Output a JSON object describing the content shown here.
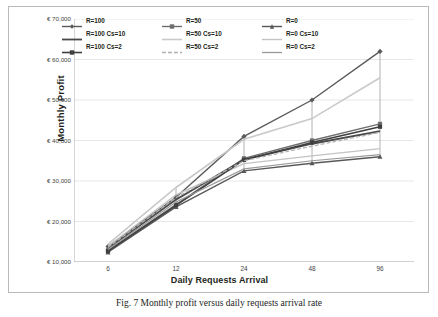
{
  "figure": {
    "caption": "Fig. 7 Monthly profit versus daily requests arrival rate",
    "background": "#ffffff",
    "border_color": "#b9b9b9"
  },
  "chart_data": {
    "type": "line",
    "title": "",
    "xlabel": "Daily Requests Arrival",
    "ylabel": "Monthly  Profit",
    "categories": [
      "6",
      "12",
      "24",
      "48",
      "96"
    ],
    "x_tick_labels": [
      "6",
      "12",
      "24",
      "48",
      "96"
    ],
    "y_tick_labels": [
      "€ 10,000",
      "€ 20,000",
      "€ 30,000",
      "€ 40,000",
      "€ 50,000",
      "€ 60,000",
      "€ 70,000"
    ],
    "y_tick_values": [
      10000,
      20000,
      30000,
      40000,
      50000,
      60000,
      70000
    ],
    "ylim": [
      10000,
      70000
    ],
    "grid": true,
    "grid_axis": "y",
    "legend_position": "top",
    "legend_columns": 3,
    "series": [
      {
        "name": "R=100",
        "color": "#5a5a5a",
        "marker": "diamond",
        "width": 1.4,
        "dash": "none",
        "values": [
          13800,
          26000,
          41000,
          50000,
          62000
        ]
      },
      {
        "name": "R=50",
        "color": "#6e6e6e",
        "marker": "square",
        "width": 1.4,
        "dash": "none",
        "values": [
          12900,
          24200,
          35600,
          40000,
          44100
        ]
      },
      {
        "name": "R=0",
        "color": "#585858",
        "marker": "triangle",
        "width": 1.4,
        "dash": "none",
        "values": [
          12400,
          23600,
          32500,
          34400,
          36000
        ]
      },
      {
        "name": "R=100 Cs=10",
        "color": "#4a4a4a",
        "marker": "none",
        "width": 1.8,
        "dash": "none",
        "values": [
          13400,
          25400,
          35300,
          39200,
          42300
        ]
      },
      {
        "name": "R=50 Cs=10",
        "color": "#c9c9c9",
        "marker": "none",
        "width": 1.6,
        "dash": "none",
        "values": [
          14400,
          28400,
          40300,
          45400,
          55500
        ]
      },
      {
        "name": "R=0 Cs=10",
        "color": "#c3c3c3",
        "marker": "none",
        "width": 1.4,
        "dash": "none",
        "values": [
          13900,
          26600,
          34300,
          36200,
          38000
        ]
      },
      {
        "name": "R=100 Cs=2",
        "color": "#3f3f3f",
        "marker": "square",
        "width": 1.6,
        "dash": "none",
        "values": [
          12700,
          24000,
          35200,
          39500,
          43400
        ]
      },
      {
        "name": "R=50 Cs=2",
        "color": "#b0b0b0",
        "marker": "none",
        "width": 1.2,
        "dash": "4 2",
        "values": [
          13600,
          25900,
          35000,
          38600,
          42000
        ]
      },
      {
        "name": "R=0 Cs=2",
        "color": "#9a9a9a",
        "marker": "none",
        "width": 1.2,
        "dash": "none",
        "values": [
          13100,
          24800,
          33000,
          35000,
          36500
        ]
      }
    ],
    "error_bars": {
      "present": true,
      "color": "#9e9e9e",
      "at_categories": [
        "12",
        "24",
        "48",
        "96"
      ]
    }
  }
}
